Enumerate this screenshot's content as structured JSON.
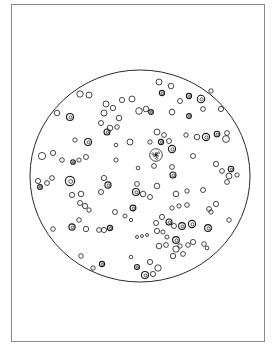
{
  "figure": {
    "frame": {
      "x": 11,
      "y": 4,
      "w": 254,
      "h": 338,
      "stroke": "#8a8a8a"
    },
    "field": {
      "cx": 140,
      "cy": 176,
      "rx": 110,
      "ry": 106,
      "stroke": "#2a2a2a"
    },
    "cell_stroke": "#1a1a1a",
    "cells": [
      [
        80,
        94,
        3.2,
        0
      ],
      [
        89,
        95,
        3,
        0
      ],
      [
        57,
        113,
        2.8,
        0
      ],
      [
        70,
        117,
        3.5,
        1
      ],
      [
        106,
        104,
        3,
        0
      ],
      [
        104,
        113,
        3,
        0
      ],
      [
        113,
        108,
        2.7,
        0
      ],
      [
        101,
        123,
        2.5,
        0
      ],
      [
        110,
        128,
        2.8,
        0
      ],
      [
        117,
        127,
        2.3,
        0
      ],
      [
        107,
        132,
        3,
        1
      ],
      [
        119,
        118,
        2.8,
        0
      ],
      [
        122,
        100,
        2.6,
        0
      ],
      [
        132,
        99,
        3,
        0
      ],
      [
        139,
        111,
        3.3,
        0
      ],
      [
        146,
        109,
        2.8,
        0
      ],
      [
        151,
        112,
        2.4,
        1
      ],
      [
        159,
        82,
        3,
        0
      ],
      [
        171,
        86,
        2.8,
        0
      ],
      [
        162,
        93,
        2.6,
        1
      ],
      [
        180,
        101,
        2.5,
        0
      ],
      [
        172,
        112,
        2.8,
        0
      ],
      [
        189,
        96,
        2.6,
        1
      ],
      [
        201,
        99,
        3.7,
        1
      ],
      [
        203,
        109,
        2.4,
        0
      ],
      [
        189,
        116,
        2.4,
        1
      ],
      [
        211,
        91,
        2.2,
        0
      ],
      [
        221,
        109,
        2.6,
        0
      ],
      [
        75,
        140,
        2.2,
        0
      ],
      [
        88,
        142,
        3.5,
        1
      ],
      [
        130,
        142,
        3,
        0
      ],
      [
        116,
        145,
        1.8,
        0
      ],
      [
        42,
        156,
        3.6,
        0
      ],
      [
        53,
        153,
        2.6,
        0
      ],
      [
        62,
        160,
        2.3,
        0
      ],
      [
        73,
        162,
        2.3,
        1
      ],
      [
        79,
        160,
        2.1,
        0
      ],
      [
        86,
        157,
        2.5,
        0
      ],
      [
        116,
        160,
        2.1,
        0
      ],
      [
        157,
        132,
        3,
        0
      ],
      [
        164,
        135,
        2.4,
        0
      ],
      [
        161,
        142,
        2.6,
        1
      ],
      [
        150,
        142,
        2.2,
        0
      ],
      [
        169,
        141,
        2.5,
        0
      ],
      [
        172,
        149,
        3.6,
        1
      ],
      [
        156,
        155,
        6.3,
        2
      ],
      [
        154,
        166,
        2.4,
        0
      ],
      [
        186,
        135,
        2.2,
        0
      ],
      [
        197,
        137,
        2.8,
        0
      ],
      [
        206,
        137,
        3.6,
        1
      ],
      [
        217,
        134,
        2.8,
        1
      ],
      [
        227,
        133,
        2.4,
        0
      ],
      [
        226,
        139,
        3.4,
        0
      ],
      [
        193,
        156,
        2.5,
        0
      ],
      [
        138,
        168,
        1.8,
        0
      ],
      [
        172,
        167,
        2.4,
        0
      ],
      [
        173,
        175,
        3,
        1
      ],
      [
        216,
        164,
        2.6,
        0
      ],
      [
        222,
        171,
        2.4,
        0
      ],
      [
        231,
        169,
        2.8,
        1
      ],
      [
        229,
        176,
        2.9,
        0
      ],
      [
        237,
        175,
        2.1,
        0
      ],
      [
        227,
        182,
        2.4,
        0
      ],
      [
        38,
        181,
        2.6,
        0
      ],
      [
        40,
        187,
        2.4,
        1
      ],
      [
        47,
        183,
        2.4,
        0
      ],
      [
        52,
        178,
        2.4,
        0
      ],
      [
        70,
        181,
        4.6,
        1
      ],
      [
        104,
        178,
        2.6,
        0
      ],
      [
        108,
        185,
        3.1,
        1
      ],
      [
        101,
        192,
        2.5,
        0
      ],
      [
        72,
        195,
        2.6,
        0
      ],
      [
        81,
        194,
        2.8,
        0
      ],
      [
        80,
        203,
        2.5,
        0
      ],
      [
        85,
        206,
        2.6,
        0
      ],
      [
        89,
        210,
        2.2,
        0
      ],
      [
        115,
        212,
        2.5,
        0
      ],
      [
        125,
        216,
        2,
        0
      ],
      [
        131,
        220,
        1.7,
        0
      ],
      [
        137,
        184,
        2.4,
        0
      ],
      [
        136,
        192,
        3.5,
        1
      ],
      [
        143,
        194,
        2.8,
        0
      ],
      [
        150,
        197,
        2.5,
        0
      ],
      [
        157,
        186,
        2.8,
        0
      ],
      [
        176,
        194,
        2.8,
        0
      ],
      [
        187,
        191,
        2.2,
        0
      ],
      [
        203,
        190,
        2.5,
        0
      ],
      [
        172,
        208,
        2.2,
        0
      ],
      [
        179,
        206,
        2.1,
        0
      ],
      [
        187,
        205,
        2.3,
        0
      ],
      [
        209,
        209,
        2.4,
        0
      ],
      [
        216,
        204,
        2.6,
        0
      ],
      [
        211,
        212,
        2.2,
        0
      ],
      [
        229,
        220,
        2.3,
        0
      ],
      [
        133,
        208,
        2.9,
        1
      ],
      [
        53,
        229,
        2.3,
        0
      ],
      [
        72,
        227,
        3.1,
        1
      ],
      [
        79,
        220,
        2.3,
        0
      ],
      [
        86,
        229,
        2.7,
        0
      ],
      [
        99,
        230,
        2.4,
        0
      ],
      [
        104,
        230,
        2.6,
        0
      ],
      [
        110,
        228,
        2.6,
        1
      ],
      [
        156,
        223,
        2.5,
        0
      ],
      [
        162,
        217,
        2.6,
        0
      ],
      [
        169,
        222,
        3,
        1
      ],
      [
        157,
        231,
        2.6,
        0
      ],
      [
        163,
        232,
        2.1,
        0
      ],
      [
        174,
        226,
        2.5,
        0
      ],
      [
        182,
        226,
        3.4,
        1
      ],
      [
        192,
        224,
        3.6,
        1
      ],
      [
        167,
        237,
        2,
        0
      ],
      [
        208,
        228,
        3.4,
        1
      ],
      [
        137,
        237,
        1.5,
        0
      ],
      [
        142,
        236,
        1.5,
        0
      ],
      [
        147,
        235,
        1.5,
        0
      ],
      [
        159,
        246,
        2.8,
        0
      ],
      [
        166,
        245,
        2.4,
        0
      ],
      [
        176,
        240,
        3.4,
        1
      ],
      [
        176,
        249,
        3.2,
        0
      ],
      [
        180,
        246,
        2.2,
        0
      ],
      [
        188,
        245,
        2.3,
        0
      ],
      [
        193,
        242,
        2.6,
        0
      ],
      [
        173,
        256,
        2.7,
        0
      ],
      [
        183,
        254,
        2.4,
        0
      ],
      [
        204,
        244,
        2.3,
        0
      ],
      [
        207,
        248,
        1.9,
        0
      ],
      [
        81,
        256,
        2.3,
        0
      ],
      [
        93,
        268,
        2.2,
        0
      ],
      [
        102,
        264,
        2.6,
        1
      ],
      [
        131,
        257,
        1.8,
        0
      ],
      [
        137,
        267,
        2.5,
        1
      ],
      [
        150,
        262,
        2.6,
        0
      ],
      [
        158,
        268,
        3.2,
        0
      ],
      [
        145,
        275,
        3.5,
        1
      ],
      [
        153,
        274,
        2.6,
        0
      ]
    ]
  }
}
